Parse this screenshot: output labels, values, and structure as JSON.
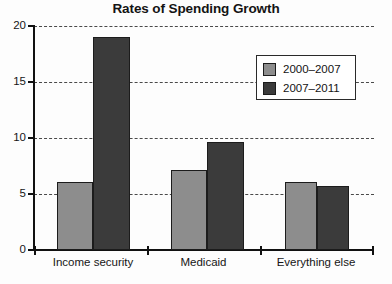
{
  "chart_data": {
    "type": "bar",
    "title": "Rates of Spending Growth",
    "xlabel": "",
    "ylabel": "",
    "ylim": [
      0,
      20
    ],
    "yticks": [
      0,
      5,
      10,
      15,
      20
    ],
    "ytick_labels": [
      "0",
      "5",
      "10",
      "15",
      "20"
    ],
    "grid": true,
    "grid_axis": "y",
    "grid_style": "dashed",
    "legend_position": "upper right",
    "categories": [
      "Income security",
      "Medicaid",
      "Everything else"
    ],
    "series": [
      {
        "name": "2000–2007",
        "color": "#8d8d8d",
        "values": [
          6.1,
          7.1,
          6.1
        ]
      },
      {
        "name": "2007–2011",
        "color": "#3b3b3b",
        "values": [
          19.0,
          9.6,
          5.7
        ]
      }
    ]
  },
  "colors": {
    "series_light": "#8d8d8d",
    "series_dark": "#3b3b3b",
    "axis": "#111111",
    "grid": "#4a4a4a",
    "text": "#161616",
    "background": "#fdfdfd"
  }
}
